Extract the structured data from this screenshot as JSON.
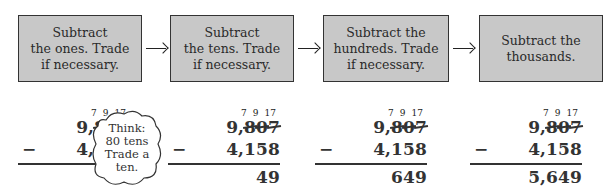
{
  "steps": [
    {
      "label": "Subtract\nthe ones. Trade\nif necessary."
    },
    {
      "label": "Subtract\nthe tens. Trade\nif necessary."
    },
    {
      "label": "Subtract the\nhundreds. Trade\nif necessary."
    },
    {
      "label": "Subtract the\nthousands."
    }
  ],
  "problem": {
    "trade_marks": [
      "7",
      "9",
      "17"
    ],
    "minuend": [
      "9",
      ",",
      "8",
      "0",
      "7"
    ],
    "subtrahend": [
      "4",
      ",",
      "1",
      "5",
      "8"
    ],
    "minus_sign": "−"
  },
  "results": [
    {
      "digits": [
        "",
        "",
        "",
        "",
        "9"
      ]
    },
    {
      "digits": [
        "",
        "",
        "",
        "4",
        "9"
      ]
    },
    {
      "digits": [
        "",
        "",
        "6",
        "4",
        "9"
      ]
    },
    {
      "digits": [
        "5",
        ",",
        "6",
        "4",
        "9"
      ]
    }
  ],
  "thought_bubble": {
    "text": "Think:\n80 tens\nTrade a\nten."
  },
  "colors": {
    "box_fill": "#c8c8c8",
    "border": "#333333",
    "text": "#333333"
  }
}
